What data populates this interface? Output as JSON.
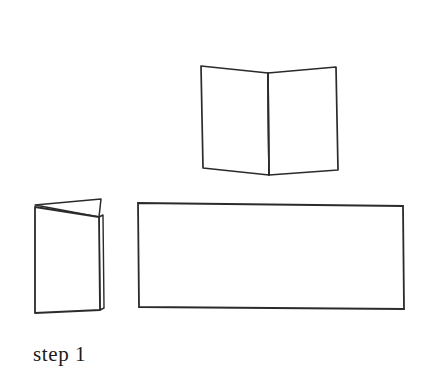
{
  "page": {
    "background_color": "#ffffff",
    "title": "step 1",
    "kind": "paper-folding instruction diagram"
  },
  "caption": {
    "text": "step 1"
  },
  "style": {
    "stroke_color": "#2b2b2b",
    "stroke_color_light": "#4a4a4a",
    "fill_color": "#ffffff",
    "stroke_width": "1.6",
    "stroke_width_thin": "1.1"
  },
  "figures": {
    "open_card": {
      "label": "open folded card standing in a V",
      "left_panel_points": "201,66 268,73 269,175 203,168",
      "right_panel_points": "268,73 336,67 338,170 269,175",
      "fold_line": "268,73 269,175",
      "top_left": "201,66",
      "top_apex": "268,73",
      "top_right": "336,67",
      "bottom_left": "203,168",
      "bottom_apex": "269,175",
      "bottom_right": "338,170"
    },
    "folded_card": {
      "label": "card folded in half, standing slightly open",
      "front_panel_points": "35,207 99,217 100,310 35,313",
      "back_sliver_points": "35,205 101,199 99,217",
      "spine_points": "99,217 103,215 104,308 100,310",
      "top_left": "35,205",
      "top_right": "101,199",
      "bottom_left": "35,313",
      "bottom_right": "100,310"
    },
    "flat_sheet": {
      "label": "unfolded flat rectangular sheet of paper",
      "points": "138,203 403,206 404,309 139,307",
      "top_left": "138,203",
      "top_right": "403,206",
      "bottom_right": "404,309",
      "bottom_left": "139,307"
    }
  }
}
